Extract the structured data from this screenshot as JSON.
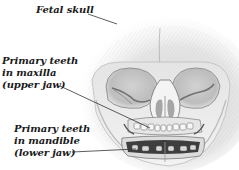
{
  "figure": {
    "colors": {
      "background": "#ffffff",
      "bone_light": "#eeeeee",
      "bone_mid": "#c8c8c8",
      "bone_dark": "#6a6a6a",
      "label_text": "#1a1a1a",
      "leader_line": "#333333"
    }
  },
  "labels": {
    "skull": {
      "lines": [
        "Fetal skull"
      ]
    },
    "maxilla": {
      "lines": [
        "Primary teeth",
        "in maxilla",
        "(upper jaw)"
      ]
    },
    "mandible": {
      "lines": [
        "Primary teeth",
        "in mandible",
        "(lower jaw)"
      ]
    }
  }
}
